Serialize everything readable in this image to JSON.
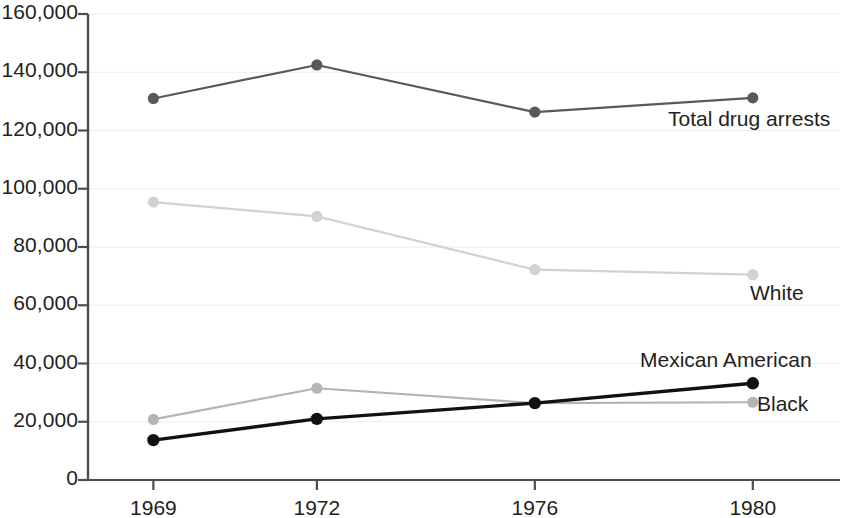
{
  "chart_data": {
    "type": "line",
    "title": "",
    "subtitle": "",
    "xlabel": "",
    "ylabel": "",
    "categories": [
      "1969",
      "1972",
      "1976",
      "1980"
    ],
    "x": [
      1969,
      1972,
      1976,
      1980
    ],
    "ylim": [
      0,
      160000
    ],
    "xlim": [
      1967.8,
      1981.6
    ],
    "grid": true,
    "grid_axis": "y",
    "legend_position": "inline-right-of-last-point",
    "ytick_labels": [
      "0",
      "20,000",
      "40,000",
      "60,000",
      "80,000",
      "100,000",
      "120,000",
      "140,000",
      "160,000"
    ],
    "ytick_values": [
      0,
      20000,
      40000,
      60000,
      80000,
      100000,
      120000,
      140000,
      160000
    ],
    "series": [
      {
        "name": "Total drug arrests",
        "color": "#595959",
        "marker": "circle",
        "values": [
          131000,
          142500,
          126300,
          131200
        ]
      },
      {
        "name": "White",
        "color": "#d2d2d2",
        "marker": "circle",
        "values": [
          95400,
          90500,
          72200,
          70500
        ]
      },
      {
        "name": "Mexican American",
        "color": "#111111",
        "marker": "circle",
        "values": [
          13700,
          21000,
          26400,
          33200
        ]
      },
      {
        "name": "Black",
        "color": "#b4b4b4",
        "marker": "circle",
        "values": [
          20800,
          31500,
          26400,
          26700
        ]
      }
    ],
    "annotations": [
      {
        "text": "Total drug arrests",
        "anchor_series": "Total drug arrests",
        "anchor_point": "1980"
      },
      {
        "text": "White",
        "anchor_series": "White",
        "anchor_point": "1980"
      },
      {
        "text": "Mexican American",
        "anchor_series": "Mexican American",
        "anchor_point": "1980"
      },
      {
        "text": "Black",
        "anchor_series": "Black",
        "anchor_point": "1980"
      }
    ]
  },
  "axes": {
    "axis_color": "#4d4d4d",
    "gridline_color": "#ececec",
    "tick_color": "#4d4d4d",
    "text_color": "#231f20"
  },
  "series_labels": {
    "total": "Total drug arrests",
    "white": "White",
    "mexican_american": "Mexican American",
    "black": "Black"
  }
}
